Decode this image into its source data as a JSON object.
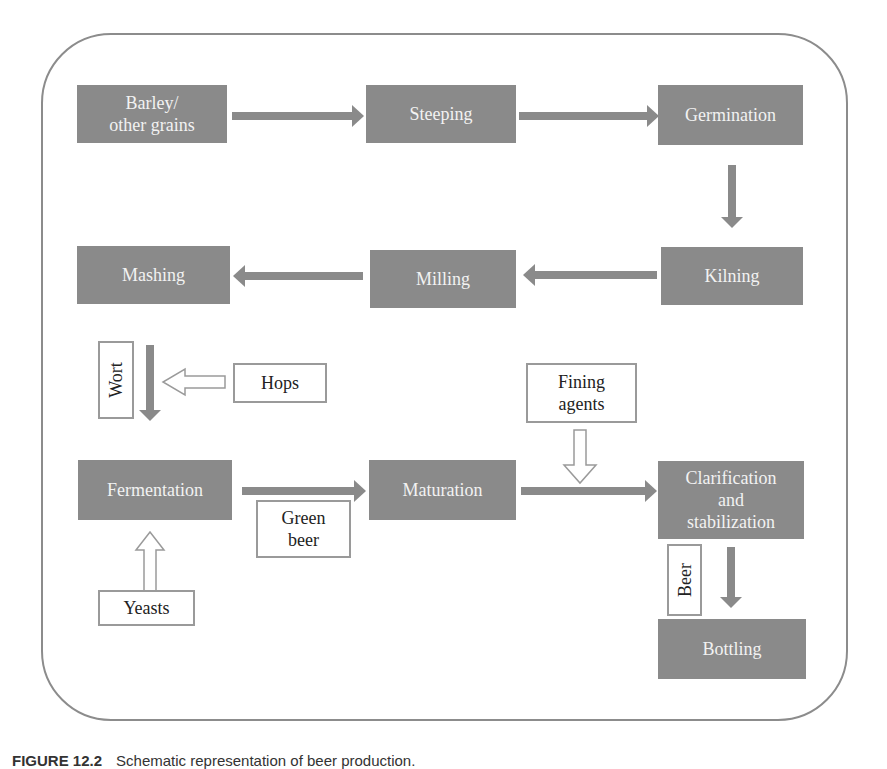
{
  "diagram": {
    "colors": {
      "process_fill": "#8a8a8a",
      "process_text": "#f2f2f2",
      "arrow": "#8a8a8a",
      "frame": "#8c8c8c",
      "label_border": "#9a9a9a"
    },
    "process_steps": [
      {
        "id": "barley",
        "label": "Barley/\nother grains"
      },
      {
        "id": "steeping",
        "label": "Steeping"
      },
      {
        "id": "germination",
        "label": "Germination"
      },
      {
        "id": "kilning",
        "label": "Kilning"
      },
      {
        "id": "milling",
        "label": "Milling"
      },
      {
        "id": "mashing",
        "label": "Mashing"
      },
      {
        "id": "fermentation",
        "label": "Fermentation"
      },
      {
        "id": "maturation",
        "label": "Maturation"
      },
      {
        "id": "clarification",
        "label": "Clarification\nand\nstabilization"
      },
      {
        "id": "bottling",
        "label": "Bottling"
      }
    ],
    "inputs": [
      {
        "id": "hops",
        "label": "Hops",
        "into": "wort"
      },
      {
        "id": "yeasts",
        "label": "Yeasts",
        "into": "fermentation"
      },
      {
        "id": "fining",
        "label": "Fining\nagents",
        "into": "maturation-to-clarification"
      }
    ],
    "flow_labels": [
      {
        "id": "wort",
        "label": "Wort",
        "between": [
          "mashing",
          "fermentation"
        ]
      },
      {
        "id": "green-beer",
        "label": "Green\nbeer",
        "between": [
          "fermentation",
          "maturation"
        ]
      },
      {
        "id": "beer",
        "label": "Beer",
        "between": [
          "clarification",
          "bottling"
        ]
      }
    ],
    "edges": [
      [
        "barley",
        "steeping"
      ],
      [
        "steeping",
        "germination"
      ],
      [
        "germination",
        "kilning"
      ],
      [
        "kilning",
        "milling"
      ],
      [
        "milling",
        "mashing"
      ],
      [
        "mashing",
        "fermentation"
      ],
      [
        "fermentation",
        "maturation"
      ],
      [
        "maturation",
        "clarification"
      ],
      [
        "clarification",
        "bottling"
      ]
    ]
  },
  "caption": {
    "number": "FIGURE 12.2",
    "text": "Schematic representation of beer production."
  }
}
